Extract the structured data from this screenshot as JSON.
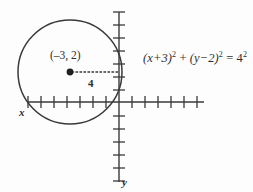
{
  "figure": {
    "kind": "coordinate-plane-circle-diagram",
    "background_color": "#fdfdfd",
    "ink_color": "#3a3a3a",
    "equation": {
      "lhs_term1_base": "(x+3)",
      "lhs_term1_exp": "2",
      "plus": "+",
      "lhs_term2_base": "(y−2)",
      "lhs_term2_exp": "2",
      "equals": "=",
      "rhs_base": "4",
      "rhs_exp": "2",
      "plain": "(x+3)² + (y−2)² = 4²"
    },
    "center_point": {
      "label": "(–3, 2)",
      "x": -3,
      "y": 2
    },
    "radius": {
      "label": "4",
      "value": 4
    },
    "axes": {
      "x_label": "x",
      "y_label": "y",
      "x_tick_count": 13,
      "y_tick_count": 13,
      "origin_px": [
        119,
        102
      ],
      "tick_spacing_px": 13,
      "x_axis_span_px": [
        28,
        204
      ],
      "y_axis_span_px": [
        12,
        182
      ]
    },
    "circle": {
      "center_px": [
        70,
        72
      ],
      "radius_px": 52
    },
    "guide_line": {
      "style": "dotted",
      "from_px": [
        70,
        72
      ],
      "to_px": [
        119,
        72
      ]
    }
  }
}
